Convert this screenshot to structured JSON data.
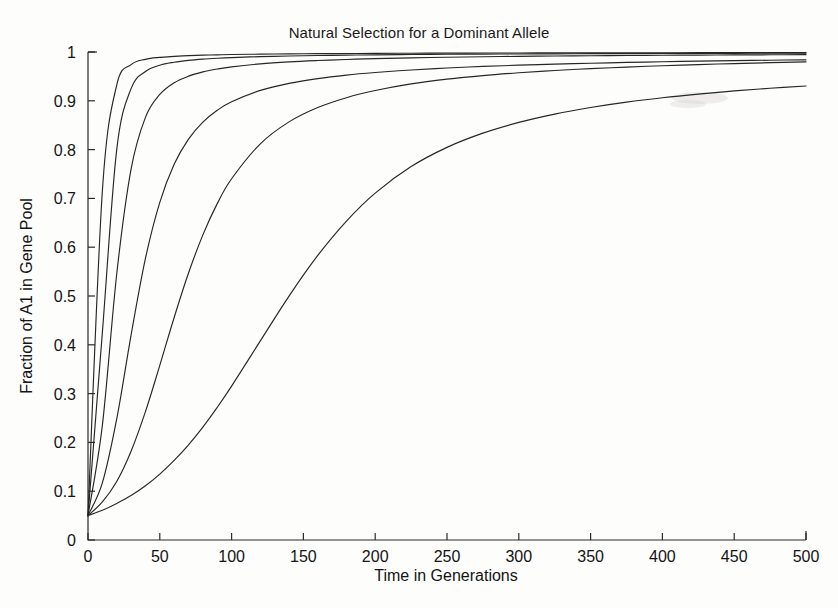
{
  "chart_data": {
    "type": "line",
    "title": "Natural Selection for a Dominant Allele",
    "xlabel": "Time in Generations",
    "ylabel": "Fraction of A1 in Gene Pool",
    "xlim": [
      0,
      500
    ],
    "ylim": [
      0,
      1
    ],
    "xticks": [
      0,
      50,
      100,
      150,
      200,
      250,
      300,
      350,
      400,
      450,
      500
    ],
    "yticks": [
      0,
      0.1,
      0.2,
      0.3,
      0.4,
      0.5,
      0.6,
      0.7,
      0.8,
      0.9,
      1
    ],
    "xtick_labels": [
      "0",
      "50",
      "100",
      "150",
      "200",
      "250",
      "300",
      "350",
      "400",
      "450",
      "500"
    ],
    "ytick_labels": [
      "0",
      "0.1",
      "0.2",
      "0.3",
      "0.4",
      "0.5",
      "0.6",
      "0.7",
      "0.8",
      "0.9",
      "1"
    ],
    "grid": false,
    "legend": false,
    "legend_position": "none",
    "initial_frequency": 0.05,
    "line_color": "#262626",
    "background_color": "#fdfdfc",
    "x": [
      0,
      10,
      20,
      30,
      40,
      50,
      60,
      70,
      80,
      90,
      100,
      120,
      140,
      160,
      180,
      200,
      225,
      250,
      275,
      300,
      325,
      350,
      375,
      400,
      425,
      450,
      475,
      500
    ],
    "series": [
      {
        "name": "curve-1",
        "selection_coefficient": 0.5,
        "values": [
          0.05,
          0.715,
          0.932,
          0.974,
          0.985,
          0.989,
          0.991,
          0.9925,
          0.9935,
          0.9942,
          0.9948,
          0.9956,
          0.9962,
          0.9966,
          0.9969,
          0.9972,
          0.9975,
          0.9977,
          0.9979,
          0.998,
          0.9982,
          0.9983,
          0.9984,
          0.9985,
          0.9986,
          0.9986,
          0.9987,
          0.9988
        ]
      },
      {
        "name": "curve-2",
        "selection_coefficient": 0.3,
        "values": [
          0.05,
          0.425,
          0.8,
          0.925,
          0.96,
          0.973,
          0.979,
          0.9828,
          0.9853,
          0.9871,
          0.9885,
          0.9905,
          0.9918,
          0.9928,
          0.9936,
          0.9942,
          0.9948,
          0.9953,
          0.9957,
          0.996,
          0.9963,
          0.9966,
          0.9968,
          0.997,
          0.9972,
          0.9973,
          0.9974,
          0.9976
        ]
      },
      {
        "name": "curve-3",
        "selection_coefficient": 0.18,
        "values": [
          0.05,
          0.235,
          0.545,
          0.76,
          0.866,
          0.913,
          0.937,
          0.9505,
          0.9592,
          0.9652,
          0.9696,
          0.9757,
          0.9797,
          0.9825,
          0.9847,
          0.9863,
          0.988,
          0.9892,
          0.9902,
          0.9911,
          0.9918,
          0.9924,
          0.9929,
          0.9933,
          0.9937,
          0.994,
          0.9943,
          0.9946
        ]
      },
      {
        "name": "curve-4",
        "selection_coefficient": 0.09,
        "values": [
          0.05,
          0.117,
          0.248,
          0.42,
          0.577,
          0.692,
          0.77,
          0.8215,
          0.8563,
          0.8806,
          0.8981,
          0.9213,
          0.9357,
          0.9455,
          0.9526,
          0.9579,
          0.9632,
          0.9672,
          0.9704,
          0.973,
          0.9752,
          0.977,
          0.9786,
          0.98,
          0.9812,
          0.9822,
          0.9832,
          0.984
        ]
      },
      {
        "name": "curve-5",
        "selection_coefficient": 0.045,
        "values": [
          0.05,
          0.078,
          0.12,
          0.182,
          0.263,
          0.358,
          0.456,
          0.547,
          0.6253,
          0.6893,
          0.7402,
          0.8119,
          0.8568,
          0.8862,
          0.9064,
          0.921,
          0.9346,
          0.9443,
          0.9517,
          0.9574,
          0.9621,
          0.9659,
          0.9691,
          0.9719,
          0.9742,
          0.9763,
          0.9781,
          0.9797
        ]
      },
      {
        "name": "curve-6",
        "selection_coefficient": 0.018,
        "values": [
          0.05,
          0.061,
          0.075,
          0.091,
          0.111,
          0.135,
          0.163,
          0.195,
          0.2314,
          0.2717,
          0.3152,
          0.408,
          0.4998,
          0.5831,
          0.6536,
          0.7108,
          0.7652,
          0.8046,
          0.8337,
          0.8557,
          0.8728,
          0.8863,
          0.8973,
          0.9063,
          0.9138,
          0.9202,
          0.9257,
          0.9304
        ]
      }
    ]
  }
}
